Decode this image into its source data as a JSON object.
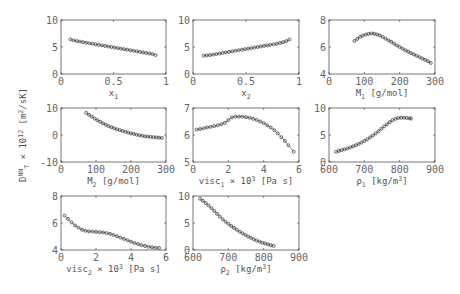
{
  "figure": {
    "ylabel_main": "D",
    "ylabel_sup": "NN",
    "ylabel_sub": "T",
    "ylabel_mid": " × 10",
    "ylabel_exp": "12",
    "ylabel_units": " [m",
    "ylabel_units_sup": "2",
    "ylabel_units_end": "/sK]"
  },
  "chart_data": [
    {
      "type": "scatter",
      "id": "x1",
      "xlabel": "x1",
      "xlabel_parts": {
        "base": "x",
        "sub": "1",
        "rest": ""
      },
      "ylabel": "D_T^NN × 10^12 [m^2/sK]",
      "xlim": [
        0,
        1
      ],
      "ylim": [
        0,
        10
      ],
      "xticks": [
        0,
        0.5,
        1
      ],
      "xticklabels": [
        "0",
        "0.5",
        "1"
      ],
      "yticks": [
        0,
        5,
        10
      ],
      "yticklabels": [
        "0",
        "5",
        "10"
      ],
      "x": [
        0.09,
        0.12,
        0.15,
        0.18,
        0.21,
        0.24,
        0.27,
        0.3,
        0.33,
        0.36,
        0.39,
        0.42,
        0.45,
        0.48,
        0.51,
        0.54,
        0.57,
        0.6,
        0.63,
        0.66,
        0.69,
        0.72,
        0.75,
        0.78,
        0.81,
        0.84,
        0.87,
        0.9
      ],
      "y": [
        6.4,
        6.25,
        6.1,
        6.0,
        5.9,
        5.8,
        5.7,
        5.6,
        5.5,
        5.4,
        5.3,
        5.2,
        5.1,
        5.0,
        4.9,
        4.8,
        4.7,
        4.6,
        4.5,
        4.4,
        4.3,
        4.2,
        4.1,
        4.0,
        3.9,
        3.8,
        3.7,
        3.5
      ]
    },
    {
      "type": "scatter",
      "id": "x2",
      "xlabel": "x2",
      "xlabel_parts": {
        "base": "x",
        "sub": "2",
        "rest": ""
      },
      "xlim": [
        0,
        1
      ],
      "ylim": [
        0,
        10
      ],
      "xticks": [
        0,
        0.5,
        1
      ],
      "xticklabels": [
        "0",
        "0.5",
        "1"
      ],
      "yticks": [
        0,
        5,
        10
      ],
      "yticklabels": [
        "0",
        "5",
        "10"
      ],
      "x": [
        0.1,
        0.13,
        0.16,
        0.19,
        0.22,
        0.25,
        0.28,
        0.31,
        0.34,
        0.37,
        0.4,
        0.43,
        0.46,
        0.49,
        0.52,
        0.55,
        0.58,
        0.61,
        0.64,
        0.67,
        0.7,
        0.73,
        0.76,
        0.79,
        0.82,
        0.85,
        0.88,
        0.91
      ],
      "y": [
        3.4,
        3.45,
        3.5,
        3.6,
        3.7,
        3.8,
        3.9,
        4.0,
        4.1,
        4.2,
        4.3,
        4.4,
        4.5,
        4.6,
        4.7,
        4.8,
        4.9,
        5.0,
        5.1,
        5.2,
        5.3,
        5.4,
        5.5,
        5.6,
        5.75,
        5.9,
        6.1,
        6.4
      ]
    },
    {
      "type": "scatter",
      "id": "M1",
      "xlabel": "M1 [g/mol]",
      "xlabel_parts": {
        "base": "M",
        "sub": "1",
        "rest": " [g/mol]"
      },
      "xlim": [
        0,
        300
      ],
      "ylim": [
        4,
        8
      ],
      "xticks": [
        0,
        100,
        200,
        300
      ],
      "xticklabels": [
        "0",
        "100",
        "200",
        "300"
      ],
      "yticks": [
        4,
        6,
        8
      ],
      "yticklabels": [
        "4",
        "6",
        "8"
      ],
      "x": [
        72,
        80,
        88,
        96,
        104,
        112,
        120,
        128,
        136,
        144,
        152,
        160,
        168,
        176,
        184,
        192,
        200,
        208,
        216,
        224,
        232,
        240,
        248,
        256,
        264,
        272,
        280,
        288
      ],
      "y": [
        6.45,
        6.6,
        6.75,
        6.85,
        6.92,
        6.97,
        7.0,
        6.98,
        6.93,
        6.85,
        6.75,
        6.62,
        6.5,
        6.38,
        6.25,
        6.12,
        6.0,
        5.88,
        5.76,
        5.65,
        5.55,
        5.45,
        5.35,
        5.25,
        5.15,
        5.05,
        4.95,
        4.82
      ]
    },
    {
      "type": "scatter",
      "id": "M2",
      "xlabel": "M2 [g/mol]",
      "xlabel_parts": {
        "base": "M",
        "sub": "2",
        "rest": " [g/mol]"
      },
      "xlim": [
        0,
        300
      ],
      "ylim": [
        -10,
        10
      ],
      "xticks": [
        0,
        100,
        200,
        300
      ],
      "xticklabels": [
        "0",
        "100",
        "200",
        "300"
      ],
      "yticks": [
        -10,
        0,
        10
      ],
      "yticklabels": [
        "-10",
        "0",
        "10"
      ],
      "x": [
        72,
        80,
        88,
        96,
        104,
        112,
        120,
        128,
        136,
        144,
        152,
        160,
        168,
        176,
        184,
        192,
        200,
        208,
        216,
        224,
        232,
        240,
        248,
        256,
        264,
        272,
        280,
        288
      ],
      "y": [
        8.2,
        7.5,
        6.8,
        6.1,
        5.5,
        4.9,
        4.3,
        3.8,
        3.3,
        2.9,
        2.5,
        2.1,
        1.8,
        1.5,
        1.2,
        0.9,
        0.6,
        0.4,
        0.1,
        -0.1,
        -0.3,
        -0.5,
        -0.6,
        -0.7,
        -0.8,
        -0.9,
        -1.0,
        -1.1
      ]
    },
    {
      "type": "scatter",
      "id": "visc1",
      "xlabel": "visc1 × 10^3 [Pa s]",
      "xlabel_parts": {
        "base": "visc",
        "sub": "1",
        "rest": " × 10",
        "sup": "3",
        "tail": " [Pa s]"
      },
      "xlim": [
        0,
        6
      ],
      "ylim": [
        5,
        7
      ],
      "xticks": [
        0,
        2,
        4,
        6
      ],
      "xticklabels": [
        "0",
        "2",
        "4",
        "6"
      ],
      "yticks": [
        5,
        6,
        7
      ],
      "yticklabels": [
        "5",
        "6",
        "7"
      ],
      "x": [
        0.2,
        0.4,
        0.6,
        0.8,
        1.0,
        1.2,
        1.4,
        1.6,
        1.8,
        2.0,
        2.2,
        2.4,
        2.6,
        2.8,
        3.0,
        3.2,
        3.4,
        3.6,
        3.8,
        4.0,
        4.2,
        4.4,
        4.6,
        4.8,
        5.0,
        5.2,
        5.4,
        5.7
      ],
      "y": [
        6.2,
        6.22,
        6.25,
        6.28,
        6.3,
        6.33,
        6.36,
        6.4,
        6.45,
        6.55,
        6.65,
        6.68,
        6.68,
        6.68,
        6.66,
        6.64,
        6.6,
        6.56,
        6.5,
        6.44,
        6.36,
        6.28,
        6.18,
        6.06,
        5.92,
        5.78,
        5.62,
        5.38
      ]
    },
    {
      "type": "scatter",
      "id": "rho1",
      "xlabel": "ρ1 [kg/m^3]",
      "xlabel_parts": {
        "base": "ρ",
        "sub": "1",
        "rest": " [kg/m",
        "sup": "3",
        "tail": "]"
      },
      "xlim": [
        600,
        900
      ],
      "ylim": [
        0,
        10
      ],
      "xticks": [
        600,
        700,
        800,
        900
      ],
      "xticklabels": [
        "600",
        "700",
        "800",
        "900"
      ],
      "yticks": [
        0,
        5,
        10
      ],
      "yticklabels": [
        "0",
        "5",
        "10"
      ],
      "x": [
        620,
        628,
        636,
        644,
        652,
        660,
        668,
        676,
        684,
        692,
        700,
        708,
        716,
        724,
        732,
        740,
        748,
        756,
        764,
        772,
        780,
        788,
        796,
        804,
        812,
        820,
        828,
        832
      ],
      "y": [
        1.9,
        2.05,
        2.2,
        2.35,
        2.5,
        2.7,
        2.9,
        3.1,
        3.35,
        3.6,
        3.9,
        4.2,
        4.55,
        4.9,
        5.3,
        5.7,
        6.15,
        6.6,
        7.0,
        7.4,
        7.75,
        8.0,
        8.15,
        8.2,
        8.2,
        8.15,
        8.1,
        8.05
      ]
    },
    {
      "type": "scatter",
      "id": "visc2",
      "xlabel": "visc2 × 10^3 [Pa s]",
      "xlabel_parts": {
        "base": "visc",
        "sub": "2",
        "rest": " × 10",
        "sup": "3",
        "tail": " [Pa s]"
      },
      "xlim": [
        0,
        6
      ],
      "ylim": [
        4,
        8
      ],
      "xticks": [
        0,
        2,
        4,
        6
      ],
      "xticklabels": [
        "0",
        "2",
        "4",
        "6"
      ],
      "yticks": [
        4,
        6,
        8
      ],
      "yticklabels": [
        "4",
        "6",
        "8"
      ],
      "x": [
        0.2,
        0.4,
        0.6,
        0.8,
        1.0,
        1.2,
        1.4,
        1.6,
        1.8,
        2.0,
        2.2,
        2.4,
        2.6,
        2.8,
        3.0,
        3.2,
        3.4,
        3.6,
        3.8,
        4.0,
        4.2,
        4.4,
        4.6,
        4.8,
        5.0,
        5.2,
        5.4,
        5.6
      ],
      "y": [
        6.55,
        6.3,
        6.05,
        5.82,
        5.65,
        5.5,
        5.42,
        5.38,
        5.36,
        5.34,
        5.32,
        5.3,
        5.26,
        5.2,
        5.12,
        5.02,
        4.92,
        4.82,
        4.72,
        4.62,
        4.52,
        4.44,
        4.36,
        4.3,
        4.24,
        4.2,
        4.17,
        4.15
      ]
    },
    {
      "type": "scatter",
      "id": "rho2",
      "xlabel": "ρ2 [kg/m^3]",
      "xlabel_parts": {
        "base": "ρ",
        "sub": "2",
        "rest": " [kg/m",
        "sup": "3",
        "tail": "]"
      },
      "xlim": [
        600,
        900
      ],
      "ylim": [
        0,
        10
      ],
      "xticks": [
        600,
        700,
        800,
        900
      ],
      "xticklabels": [
        "600",
        "700",
        "800",
        "900"
      ],
      "yticks": [
        0,
        5,
        10
      ],
      "yticklabels": [
        "0",
        "5",
        "10"
      ],
      "x": [
        620,
        628,
        636,
        644,
        652,
        660,
        668,
        676,
        684,
        692,
        700,
        708,
        716,
        724,
        732,
        740,
        748,
        756,
        764,
        772,
        780,
        788,
        796,
        804,
        812,
        820,
        828
      ],
      "y": [
        9.5,
        9.1,
        8.7,
        8.25,
        7.75,
        7.25,
        6.7,
        6.2,
        5.7,
        5.25,
        4.85,
        4.45,
        4.1,
        3.75,
        3.4,
        3.1,
        2.8,
        2.5,
        2.25,
        2.0,
        1.75,
        1.55,
        1.35,
        1.2,
        1.05,
        0.9,
        0.75
      ]
    }
  ]
}
